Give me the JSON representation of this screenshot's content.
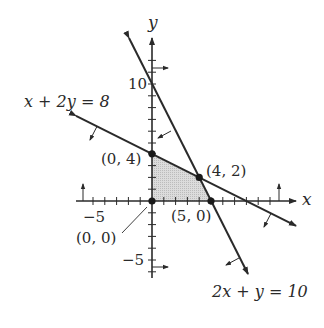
{
  "diagram": {
    "type": "linear-programming-feasible-region",
    "axes": {
      "x_label": "x",
      "y_label": "y",
      "x_tick_label_neg": "−5",
      "y_tick_label_pos": "10",
      "y_tick_label_neg": "−5"
    },
    "lines": [
      {
        "equation": "x + 2y = 8",
        "label": "x + 2y = 8"
      },
      {
        "equation": "2x + y = 10",
        "label": "2x + y = 10"
      }
    ],
    "vertices": [
      {
        "label": "(0, 0)",
        "x": 0,
        "y": 0
      },
      {
        "label": "(0, 4)",
        "x": 0,
        "y": 4
      },
      {
        "label": "(4, 2)",
        "x": 4,
        "y": 2
      },
      {
        "label": "(5, 0)",
        "x": 5,
        "y": 0
      }
    ],
    "colors": {
      "ink": "#2a2a2a",
      "region_fill": "#d4d4d4"
    }
  }
}
